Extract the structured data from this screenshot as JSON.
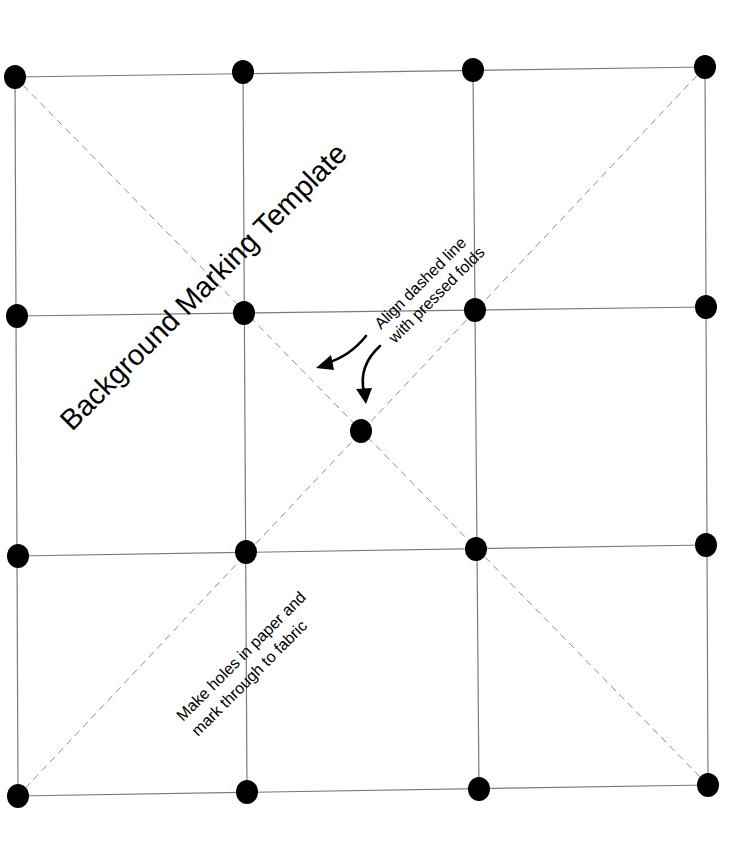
{
  "title": "Background Marking Template",
  "annotations": {
    "align_line1": "Align dashed line",
    "align_line2": "with pressed folds",
    "holes_line1": "Make holes in paper and",
    "holes_line2": "mark through to fabric"
  },
  "grid": {
    "rows": [
      [
        [
          15,
          77
        ],
        [
          243,
          72
        ],
        [
          473,
          70
        ],
        [
          705,
          67
        ]
      ],
      [
        [
          17,
          316
        ],
        [
          244,
          313
        ],
        [
          475,
          310
        ],
        [
          706,
          307
        ]
      ],
      [
        [
          18,
          556
        ],
        [
          246,
          552
        ],
        [
          476,
          549
        ],
        [
          706,
          545
        ]
      ],
      [
        [
          18,
          796
        ],
        [
          247,
          792
        ],
        [
          479,
          789
        ],
        [
          708,
          785
        ]
      ]
    ],
    "center_dot": [
      361,
      431
    ],
    "dot_radius": 11
  },
  "colors": {
    "grid_line": "#7a7a7a",
    "dashed_line": "#8c8c8c",
    "dot": "#000000",
    "text": "#000000"
  }
}
